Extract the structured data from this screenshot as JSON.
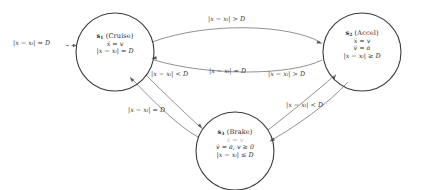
{
  "diagram": {
    "type": "hybrid-automaton-state-diagram",
    "title": "",
    "background_color": "#ffffff",
    "node_stroke_color": "#3a3a3a",
    "edge_stroke_color": "#6e6e6e",
    "text_color": "#2b2b2b"
  },
  "states": [
    {
      "id": "s1",
      "name_symbol": "s",
      "name_index": "1",
      "name": "(Cruise)",
      "cx": 115,
      "cy": 52,
      "r": 39,
      "lines": [
        {
          "text": "ẋ = v",
          "faint": false
        },
        {
          "text": "|x − xₗ| = D",
          "faint": false
        }
      ]
    },
    {
      "id": "s2",
      "name_symbol": "s",
      "name_index": "2",
      "name": "(Accel)",
      "cx": 362,
      "cy": 52,
      "r": 39,
      "lines": [
        {
          "text": "ẋ = v",
          "faint": false
        },
        {
          "text": "v̇ = a",
          "faint": false
        },
        {
          "text": "|x − xₗ| ≥ D",
          "faint": false
        }
      ]
    },
    {
      "id": "s3",
      "name_symbol": "s",
      "name_index": "3",
      "name": "(Brake)",
      "cx": 235,
      "cy": 151,
      "r": 39,
      "lines": [
        {
          "text": "ẋ = v",
          "faint": true
        },
        {
          "text": "v̇ = a, v ≥ 0",
          "faint": false
        },
        {
          "text": "|x − xₗ| ≤ D",
          "faint": false
        }
      ]
    }
  ],
  "transitions": [
    {
      "id": "init-to-s1",
      "from": "initial",
      "to": "s1",
      "label": "|x − xₗ| = D",
      "label_x": 13,
      "label_y": 39
    },
    {
      "id": "s1-to-s2",
      "from": "s1",
      "to": "s2",
      "label": "|x − xₗ| > D",
      "label_x": 208,
      "label_y": 15
    },
    {
      "id": "s2-to-s1",
      "from": "s2",
      "to": "s1",
      "label": "|x − xₗ| = D",
      "label_x": 209,
      "label_y": 67
    },
    {
      "id": "s1-to-s3",
      "from": "s1",
      "to": "s3",
      "label": "|x − xₗ| < D",
      "label_x": 151,
      "label_y": 70
    },
    {
      "id": "s3-to-s1",
      "from": "s3",
      "to": "s1",
      "label": "|x − xₗ| = D",
      "label_x": 128,
      "label_y": 106
    },
    {
      "id": "s3-to-s2",
      "from": "s3",
      "to": "s2",
      "label": "|x − xₗ| > D",
      "label_x": 268,
      "label_y": 70
    },
    {
      "id": "s2-to-s3",
      "from": "s2",
      "to": "s3",
      "label": "|x − xₗ| < D",
      "label_x": 286,
      "label_y": 101
    }
  ]
}
